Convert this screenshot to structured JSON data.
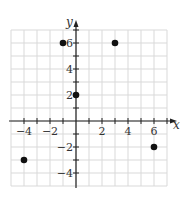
{
  "chart_data": {
    "type": "scatter",
    "title": "",
    "xlabel": "x",
    "ylabel": "y",
    "xlim": [
      -5,
      7
    ],
    "ylim": [
      -5,
      7
    ],
    "grid": true,
    "x_ticks": [
      -4,
      -2,
      2,
      4,
      6
    ],
    "y_ticks": [
      -4,
      -2,
      2,
      4,
      6
    ],
    "x_tick_labels": [
      "−4",
      "−2",
      "2",
      "4",
      "6"
    ],
    "y_tick_labels": [
      "−4",
      "−2",
      "2",
      "4",
      "6"
    ],
    "points": [
      {
        "x": -1,
        "y": 6
      },
      {
        "x": 3,
        "y": 6
      },
      {
        "x": 0,
        "y": 2
      },
      {
        "x": -4,
        "y": -3
      },
      {
        "x": 6,
        "y": -2
      }
    ],
    "colors": {
      "point": "#111111",
      "axis": "#222222",
      "grid": "#d9d9d9"
    }
  }
}
